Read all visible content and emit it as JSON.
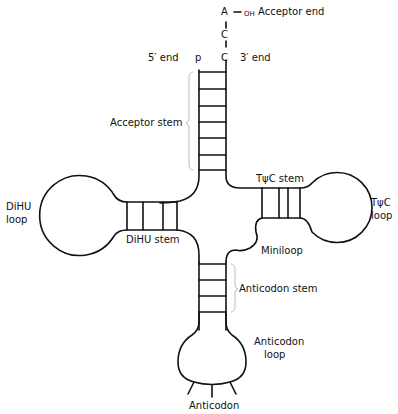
{
  "diagram": {
    "type": "tRNA cloverleaf structure",
    "acceptor_terminal": {
      "nucleotides": [
        "A",
        "C",
        "C"
      ],
      "oh_label": "OH",
      "dash": "—"
    },
    "labels": {
      "acceptor_end": "Acceptor end",
      "five_prime_end": "5′ end",
      "three_prime_end": "3′ end",
      "phosphate": "p",
      "acceptor_stem": "Acceptor stem",
      "dihu_loop_line1": "DiHU",
      "dihu_loop_line2": "loop",
      "dihu_stem": "DiHU stem",
      "tpsic_stem": "TψC stem",
      "tpsic_loop_line1": "TψC",
      "tpsic_loop_line2": "loop",
      "miniloop": "Miniloop",
      "anticodon_stem": "Anticodon stem",
      "anticodon_loop_line1": "Anticodon",
      "anticodon_loop_line2": "loop",
      "anticodon": "Anticodon"
    },
    "line_color": "#111111",
    "bracket_color": "#bbbbbb"
  }
}
